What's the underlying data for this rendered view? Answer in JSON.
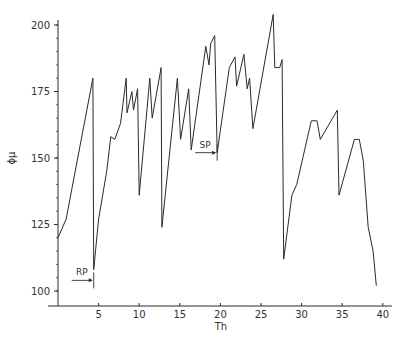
{
  "chart_data": {
    "type": "line",
    "title": "",
    "xlabel": "Th",
    "ylabel": "ϕμ",
    "xlim": [
      0,
      41
    ],
    "ylim": [
      97,
      207
    ],
    "grid": false,
    "legend": "none",
    "x_ticks": [
      5,
      10,
      15,
      20,
      25,
      30,
      35,
      40
    ],
    "x_tick_labels": [
      "5",
      "10",
      "15",
      "20",
      "25",
      "30",
      "35",
      "40"
    ],
    "y_ticks": [
      100,
      125,
      150,
      175,
      200
    ],
    "y_tick_labels": [
      "100",
      "125",
      "150",
      "175",
      "200"
    ],
    "y_minor_step": 5,
    "series": [
      {
        "name": "trace",
        "x": [
          0,
          1.0,
          4.3,
          4.4,
          5.0,
          6.0,
          6.5,
          7.0,
          7.7,
          8.4,
          8.5,
          9.1,
          9.3,
          9.8,
          10.0,
          11.3,
          11.6,
          12.7,
          12.8,
          14.7,
          15.1,
          16.1,
          16.4,
          18.2,
          18.6,
          18.8,
          19.3,
          19.6,
          21.1,
          21.8,
          22.0,
          22.9,
          23.3,
          23.6,
          24.0,
          26.5,
          26.7,
          27.3,
          27.6,
          27.8,
          28.8,
          29.4,
          31.2,
          31.9,
          32.3,
          34.4,
          34.6,
          36.5,
          37.1,
          37.6,
          38.2,
          38.8,
          39.2
        ],
        "y": [
          120,
          127,
          180,
          108,
          127,
          145,
          158,
          157,
          163,
          180,
          167,
          175,
          168,
          176,
          136,
          180,
          165,
          184,
          124,
          180,
          157,
          176,
          153,
          192,
          185,
          193,
          196,
          152,
          184,
          188,
          177,
          189,
          176,
          180,
          161,
          204,
          184,
          184,
          187,
          112,
          136,
          140,
          164,
          164,
          157,
          168,
          136,
          157,
          157,
          149,
          124,
          115,
          102
        ]
      }
    ],
    "annotations": [
      {
        "text": "RP",
        "x": 4.4,
        "y": 104,
        "arrow": "right"
      },
      {
        "text": "SP",
        "x": 19.6,
        "y": 152,
        "arrow": "right"
      }
    ]
  }
}
